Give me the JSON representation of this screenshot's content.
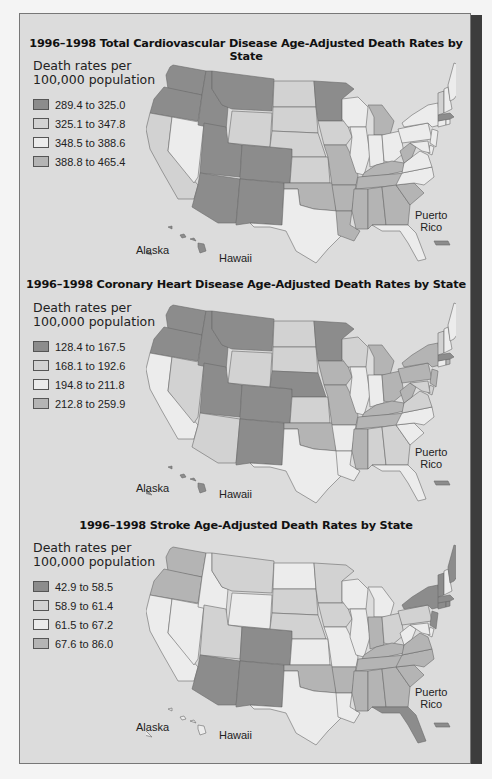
{
  "colors": {
    "c1": "#8c8c8c",
    "c2": "#d2d2d2",
    "c3": "#ececec",
    "c4": "#b4b4b4",
    "panel_bg": "#dcdcdc",
    "border": "#6a6a6a"
  },
  "labels": {
    "alaska": "Alaska",
    "hawaii": "Hawaii",
    "puerto_rico_line1": "Puerto",
    "puerto_rico_line2": "Rico"
  },
  "maps": [
    {
      "title": "1996–1998 Total Cardiovascular Disease Age-Adjusted Death Rates by State",
      "legend_heading_line1": "Death rates per",
      "legend_heading_line2": "100,000 population",
      "legend": [
        {
          "label": "289.4 to 325.0",
          "cls": "c1"
        },
        {
          "label": "325.1 to 347.8",
          "cls": "c2"
        },
        {
          "label": "348.5 to 388.6",
          "cls": "c3"
        },
        {
          "label": "388.8 to 465.4",
          "cls": "c4"
        }
      ],
      "states": {
        "WA": "c1",
        "OR": "c1",
        "ID": "c1",
        "MT": "c1",
        "WY": "c2",
        "ND": "c2",
        "SD": "c2",
        "NE": "c2",
        "KS": "c2",
        "MN": "c1",
        "CA": "c2",
        "NV": "c3",
        "UT": "c1",
        "CO": "c1",
        "AZ": "c1",
        "NM": "c1",
        "TX": "c3",
        "OK": "c4",
        "IA": "c2",
        "MO": "c4",
        "AR": "c4",
        "LA": "c4",
        "WI": "c3",
        "IL": "c3",
        "MI": "c4",
        "IN": "c3",
        "OH": "c3",
        "KY": "c4",
        "TN": "c4",
        "MS": "c4",
        "AL": "c4",
        "GA": "c4",
        "FL": "c3",
        "SC": "c4",
        "NC": "c3",
        "VA": "c3",
        "WV": "c4",
        "PA": "c3",
        "NY": "c3",
        "VT": "c2",
        "NH": "c3",
        "ME": "c3",
        "MA": "c1",
        "RI": "c3",
        "CT": "c3",
        "NJ": "c3",
        "DE": "c3",
        "MD": "c3",
        "AK": "c1",
        "HI": "c1",
        "PR": "c1"
      }
    },
    {
      "title": "1996–1998 Coronary Heart Disease Age-Adjusted Death Rates by State",
      "legend_heading_line1": "Death rates per",
      "legend_heading_line2": "100,000 population",
      "legend": [
        {
          "label": "128.4 to 167.5",
          "cls": "c1"
        },
        {
          "label": "168.1 to 192.6",
          "cls": "c2"
        },
        {
          "label": "194.8 to 211.8",
          "cls": "c3"
        },
        {
          "label": "212.8 to 259.9",
          "cls": "c4"
        }
      ],
      "states": {
        "WA": "c1",
        "OR": "c1",
        "ID": "c1",
        "MT": "c1",
        "WY": "c2",
        "ND": "c2",
        "SD": "c2",
        "NE": "c1",
        "KS": "c2",
        "MN": "c1",
        "CA": "c3",
        "NV": "c2",
        "UT": "c1",
        "CO": "c1",
        "AZ": "c2",
        "NM": "c1",
        "TX": "c3",
        "OK": "c4",
        "IA": "c4",
        "MO": "c4",
        "AR": "c3",
        "LA": "c3",
        "WI": "c2",
        "IL": "c3",
        "MI": "c4",
        "IN": "c3",
        "OH": "c4",
        "KY": "c4",
        "TN": "c4",
        "MS": "c4",
        "AL": "c2",
        "GA": "c2",
        "FL": "c3",
        "SC": "c3",
        "NC": "c3",
        "VA": "c2",
        "WV": "c4",
        "PA": "c4",
        "NY": "c4",
        "VT": "c2",
        "NH": "c3",
        "ME": "c3",
        "MA": "c1",
        "RI": "c4",
        "CT": "c3",
        "NJ": "c4",
        "DE": "c2",
        "MD": "c2",
        "AK": "c1",
        "HI": "c1",
        "PR": "c1"
      }
    },
    {
      "title": "1996–1998 Stroke Age-Adjusted Death Rates by State",
      "legend_heading_line1": "Death rates per",
      "legend_heading_line2": "100,000 population",
      "legend": [
        {
          "label": "42.9 to 58.5",
          "cls": "c1"
        },
        {
          "label": "58.9 to 61.4",
          "cls": "c2"
        },
        {
          "label": "61.5 to 67.2",
          "cls": "c3"
        },
        {
          "label": "67.6 to 86.0",
          "cls": "c4"
        }
      ],
      "states": {
        "WA": "c4",
        "OR": "c4",
        "ID": "c3",
        "MT": "c2",
        "WY": "c3",
        "ND": "c3",
        "SD": "c2",
        "NE": "c2",
        "KS": "c3",
        "MN": "c2",
        "CA": "c3",
        "NV": "c3",
        "UT": "c2",
        "CO": "c1",
        "AZ": "c1",
        "NM": "c1",
        "TX": "c3",
        "OK": "c4",
        "IA": "c2",
        "MO": "c3",
        "AR": "c4",
        "LA": "c3",
        "WI": "c3",
        "IL": "c3",
        "MI": "c3",
        "IN": "c4",
        "OH": "c2",
        "KY": "c4",
        "TN": "c4",
        "MS": "c4",
        "AL": "c4",
        "GA": "c4",
        "FL": "c1",
        "SC": "c4",
        "NC": "c4",
        "VA": "c4",
        "WV": "c3",
        "PA": "c2",
        "NY": "c1",
        "VT": "c1",
        "NH": "c3",
        "ME": "c1",
        "MA": "c1",
        "RI": "c1",
        "CT": "c1",
        "NJ": "c1",
        "DE": "c3",
        "MD": "c3",
        "AK": "c3",
        "HI": "c3",
        "PR": "c1"
      }
    }
  ]
}
